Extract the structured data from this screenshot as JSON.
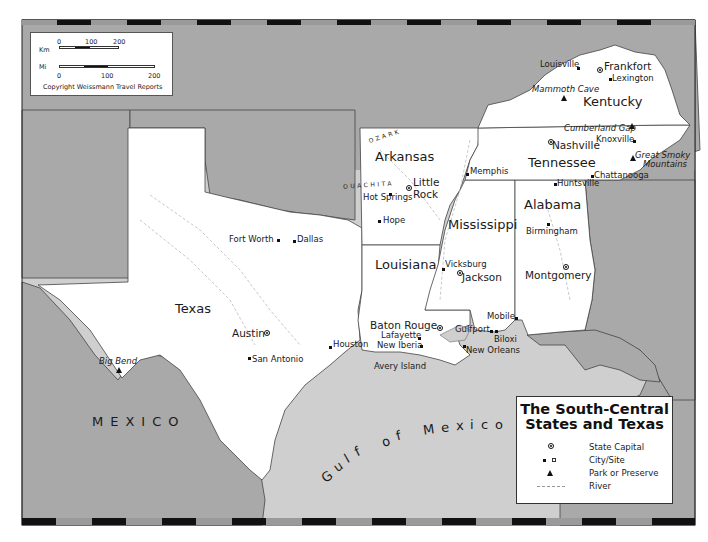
{
  "map": {
    "title_line1": "The South-Central",
    "title_line2": "States and Texas",
    "copyright": "Copyright Weissmann Travel Reports",
    "colors": {
      "land_focus": "#ffffff",
      "land_other": "#a9a9a9",
      "water": "#cfcfcf",
      "border": "#333333",
      "frame_dark": "#111111",
      "frame_light": "#9a9a9a"
    }
  },
  "scale": {
    "km_label": "Km",
    "km_ticks": [
      "0",
      "100",
      "200"
    ],
    "mi_label": "Mi",
    "mi_ticks": [
      "0",
      "100",
      "200"
    ]
  },
  "legend": {
    "items": [
      {
        "symbol": "state-capital-icon",
        "label": "State Capital"
      },
      {
        "symbol": "city-site-icon",
        "label": "City/Site"
      },
      {
        "symbol": "park-triangle-icon",
        "label": "Park or Preserve"
      },
      {
        "symbol": "river-line-icon",
        "label": "River"
      }
    ]
  },
  "states": {
    "texas": "Texas",
    "arkansas": "Arkansas",
    "louisiana": "Louisiana",
    "mississippi": "Mississippi",
    "alabama": "Alabama",
    "tennessee": "Tennessee",
    "kentucky": "Kentucky"
  },
  "regions": {
    "mexico": "MEXICO",
    "gulf": [
      "G",
      "u",
      "l",
      "f",
      "o",
      "f",
      "M",
      "e",
      "x",
      "i",
      "c",
      "o"
    ],
    "ozark": "OZARK",
    "ouachita": "OUACHITA"
  },
  "capitals": {
    "austin": "Austin",
    "little_rock_1": "Little",
    "little_rock_2": "Rock",
    "baton_rouge": "Baton Rouge",
    "jackson": "Jackson",
    "montgomery": "Montgomery",
    "nashville": "Nashville",
    "frankfort": "Frankfort"
  },
  "cities": {
    "fort_worth": "Fort Worth",
    "dallas": "Dallas",
    "san_antonio": "San Antonio",
    "houston": "Houston",
    "hot_springs": "Hot Springs",
    "hope": "Hope",
    "memphis": "Memphis",
    "vicksburg": "Vicksburg",
    "lafayette": "Lafayette",
    "new_iberia": "New Iberia",
    "avery_island": "Avery Island",
    "new_orleans": "New Orleans",
    "gulfport": "Gulfport",
    "biloxi": "Biloxi",
    "mobile": "Mobile",
    "birmingham": "Birmingham",
    "huntsville": "Huntsville",
    "chattanooga": "Chattanooga",
    "knoxville": "Knoxville",
    "louisville": "Louisville",
    "lexington": "Lexington"
  },
  "parks": {
    "big_bend": "Big Bend",
    "mammoth_cave": "Mammoth Cave",
    "cumberland_gap": "Cumberland Gap",
    "great_smoky_1": "Great Smoky",
    "great_smoky_2": "Mountains"
  }
}
